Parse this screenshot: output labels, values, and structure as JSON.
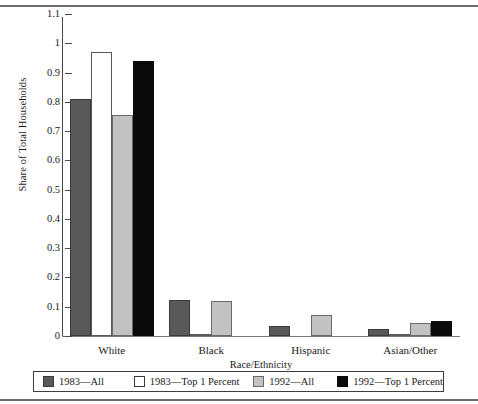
{
  "chart_data": {
    "type": "bar",
    "title": "",
    "xlabel": "Race/Ethnicity",
    "ylabel": "Share of Total Households",
    "categories": [
      "White",
      "Black",
      "Hispanic",
      "Asian/Other"
    ],
    "series": [
      {
        "name": "1983—All",
        "color": "#595959",
        "values": [
          0.81,
          0.122,
          0.035,
          0.025
        ]
      },
      {
        "name": "1983—Top 1 Percent",
        "color": "#ffffff",
        "values": [
          0.97,
          0.007,
          0.0,
          0.003
        ]
      },
      {
        "name": "1992—All",
        "color": "#c2c2c2",
        "values": [
          0.755,
          0.12,
          0.073,
          0.045
        ]
      },
      {
        "name": "1992—Top 1 Percent",
        "color": "#0a0a0a",
        "values": [
          0.94,
          0.0,
          0.0,
          0.052
        ]
      }
    ],
    "ylim": [
      0,
      1.1
    ],
    "ytick_labels": [
      "1.1",
      "1",
      "0.9",
      "0.8",
      "0.7",
      "0.6",
      "0.5",
      "0.4",
      "0.3",
      "0.2",
      "0.1",
      "0"
    ],
    "ytick_values": [
      1.1,
      1,
      0.9,
      0.8,
      0.7,
      0.6,
      0.5,
      0.4,
      0.3,
      0.2,
      0.1,
      0
    ],
    "grid": false,
    "legend_position": "bottom"
  }
}
